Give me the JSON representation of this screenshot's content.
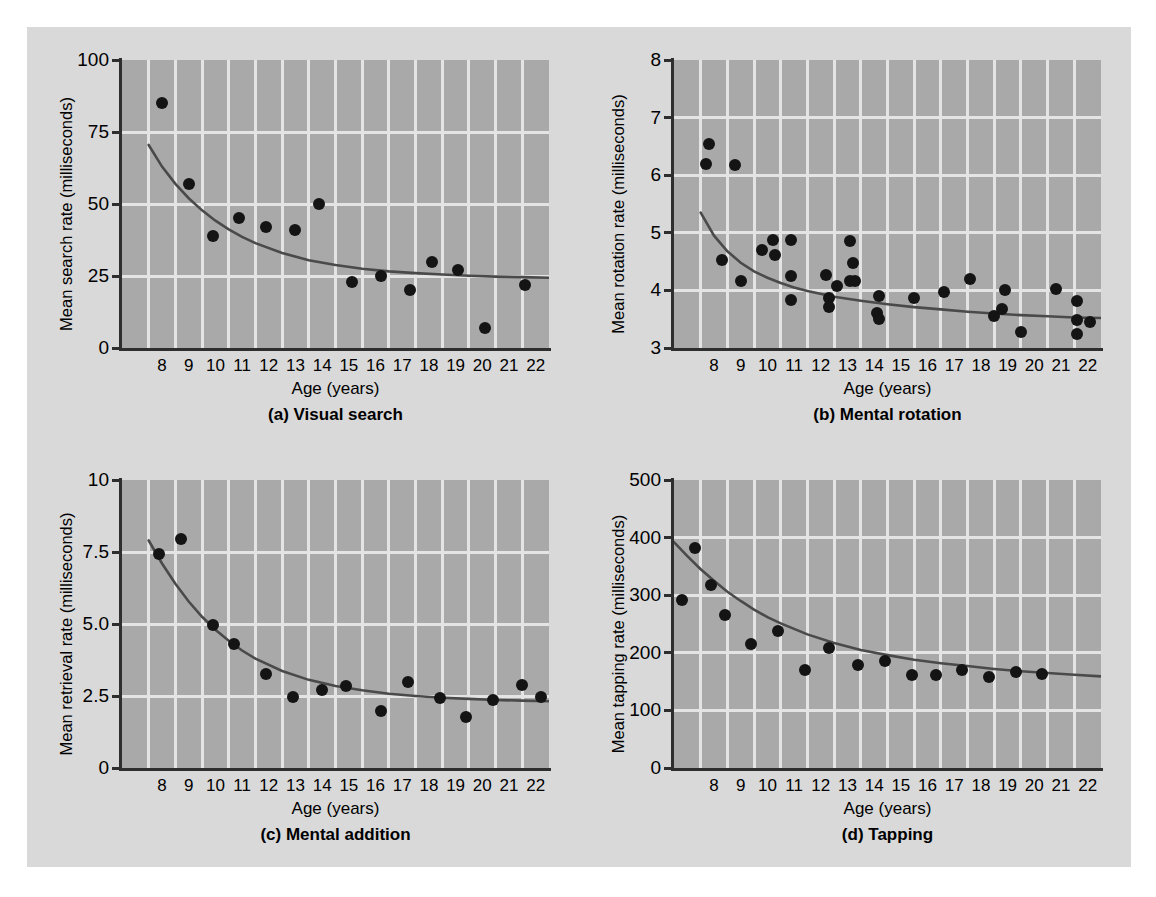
{
  "figure": {
    "background_color": "#d9d9d9",
    "plot_background_color": "#a9a9a9",
    "gridline_color": "#e4e4e4",
    "marker_color": "#141414",
    "curve_color": "#4a4a4a"
  },
  "chart_data": [
    {
      "id": "a",
      "type": "scatter",
      "title": "(a) Visual search",
      "caption": "(a) Visual search",
      "xlabel": "Age (years)",
      "ylabel": "Mean search rate (milliseconds)",
      "xlim": [
        7.0,
        23.0
      ],
      "ylim": [
        0,
        100
      ],
      "xticks": [
        8,
        9,
        10,
        11,
        12,
        13,
        14,
        15,
        16,
        17,
        18,
        19,
        20,
        21,
        22
      ],
      "xtick_labels": [
        "8",
        "9",
        "10",
        "11",
        "12",
        "13",
        "14",
        "15",
        "16",
        "17",
        "18",
        "19",
        "20",
        "21",
        "22"
      ],
      "yticks": [
        0,
        25,
        50,
        75,
        100
      ],
      "ytick_labels": [
        "0",
        "25",
        "50",
        "75",
        "100"
      ],
      "grid": true,
      "legend": "none",
      "points": [
        {
          "x": 8.5,
          "y": 85
        },
        {
          "x": 9.5,
          "y": 57
        },
        {
          "x": 10.4,
          "y": 39
        },
        {
          "x": 11.4,
          "y": 45
        },
        {
          "x": 12.4,
          "y": 42
        },
        {
          "x": 13.5,
          "y": 41
        },
        {
          "x": 14.4,
          "y": 50
        },
        {
          "x": 15.6,
          "y": 23
        },
        {
          "x": 16.7,
          "y": 25
        },
        {
          "x": 17.8,
          "y": 20
        },
        {
          "x": 18.6,
          "y": 30
        },
        {
          "x": 19.6,
          "y": 27
        },
        {
          "x": 20.6,
          "y": 7
        },
        {
          "x": 22.1,
          "y": 22
        }
      ],
      "fit_curve": {
        "label": "fitted exponential decay",
        "x": [
          8.0,
          8.5,
          9.0,
          9.5,
          10.0,
          10.5,
          11.0,
          11.5,
          12.0,
          13.0,
          14.0,
          15.0,
          16.0,
          17.0,
          18.0,
          19.0,
          20.0,
          21.0,
          22.0,
          23.0
        ],
        "y": [
          70.5,
          63.0,
          57.0,
          52.0,
          47.8,
          44.2,
          41.2,
          38.6,
          36.4,
          33.0,
          30.5,
          28.8,
          27.5,
          26.6,
          26.0,
          25.5,
          25.1,
          24.8,
          24.6,
          24.4
        ]
      }
    },
    {
      "id": "b",
      "type": "scatter",
      "title": "(b) Mental rotation",
      "caption": "(b) Mental rotation",
      "xlabel": "Age (years)",
      "ylabel": "Mean rotation rate (milliseconds)",
      "xlim": [
        7.0,
        23.0
      ],
      "ylim": [
        3,
        8
      ],
      "xticks": [
        8,
        9,
        10,
        11,
        12,
        13,
        14,
        15,
        16,
        17,
        18,
        19,
        20,
        21,
        22
      ],
      "xtick_labels": [
        "8",
        "9",
        "10",
        "11",
        "12",
        "13",
        "14",
        "15",
        "16",
        "17",
        "18",
        "19",
        "20",
        "21",
        "22"
      ],
      "yticks": [
        3,
        4,
        5,
        6,
        7,
        8
      ],
      "ytick_labels": [
        "3",
        "4",
        "5",
        "6",
        "7",
        "8"
      ],
      "grid": true,
      "legend": "none",
      "points": [
        {
          "x": 8.3,
          "y": 6.55
        },
        {
          "x": 8.2,
          "y": 6.2
        },
        {
          "x": 9.3,
          "y": 6.18
        },
        {
          "x": 8.8,
          "y": 4.52
        },
        {
          "x": 9.5,
          "y": 4.17
        },
        {
          "x": 10.3,
          "y": 4.7
        },
        {
          "x": 10.7,
          "y": 4.88
        },
        {
          "x": 10.8,
          "y": 4.62
        },
        {
          "x": 11.4,
          "y": 4.87
        },
        {
          "x": 11.4,
          "y": 4.25
        },
        {
          "x": 11.4,
          "y": 3.83
        },
        {
          "x": 12.7,
          "y": 4.27
        },
        {
          "x": 12.8,
          "y": 3.87
        },
        {
          "x": 12.8,
          "y": 3.72
        },
        {
          "x": 13.1,
          "y": 4.07
        },
        {
          "x": 13.6,
          "y": 4.85
        },
        {
          "x": 13.7,
          "y": 4.48
        },
        {
          "x": 13.6,
          "y": 4.17
        },
        {
          "x": 13.8,
          "y": 4.17
        },
        {
          "x": 14.7,
          "y": 3.9
        },
        {
          "x": 14.6,
          "y": 3.6
        },
        {
          "x": 14.7,
          "y": 3.5
        },
        {
          "x": 16.0,
          "y": 3.87
        },
        {
          "x": 17.1,
          "y": 3.98
        },
        {
          "x": 18.1,
          "y": 4.2
        },
        {
          "x": 19.0,
          "y": 3.55
        },
        {
          "x": 19.3,
          "y": 3.67
        },
        {
          "x": 19.4,
          "y": 4.0
        },
        {
          "x": 20.0,
          "y": 3.27
        },
        {
          "x": 21.3,
          "y": 4.02
        },
        {
          "x": 22.1,
          "y": 3.82
        },
        {
          "x": 22.1,
          "y": 3.48
        },
        {
          "x": 22.1,
          "y": 3.25
        },
        {
          "x": 22.6,
          "y": 3.45
        }
      ],
      "fit_curve": {
        "label": "fitted exponential decay",
        "x": [
          8.0,
          8.5,
          9.0,
          9.5,
          10.0,
          10.5,
          11.0,
          11.5,
          12.0,
          13.0,
          14.0,
          15.0,
          16.0,
          17.0,
          18.0,
          19.0,
          20.0,
          21.0,
          22.0,
          23.0
        ],
        "y": [
          5.35,
          4.95,
          4.68,
          4.48,
          4.33,
          4.22,
          4.13,
          4.05,
          3.99,
          3.89,
          3.82,
          3.76,
          3.71,
          3.67,
          3.63,
          3.6,
          3.57,
          3.55,
          3.53,
          3.52
        ]
      }
    },
    {
      "id": "c",
      "type": "scatter",
      "title": "(c) Mental addition",
      "caption": "(c) Mental addition",
      "xlabel": "Age (years)",
      "ylabel": "Mean retrieval rate (milliseconds)",
      "xlim": [
        7.0,
        23.0
      ],
      "ylim": [
        0,
        10
      ],
      "xticks": [
        8,
        9,
        10,
        11,
        12,
        13,
        14,
        15,
        16,
        17,
        18,
        19,
        20,
        21,
        22
      ],
      "xtick_labels": [
        "8",
        "9",
        "10",
        "11",
        "12",
        "13",
        "14",
        "15",
        "16",
        "17",
        "18",
        "19",
        "20",
        "21",
        "22"
      ],
      "yticks": [
        0,
        2.5,
        5.0,
        7.5,
        10
      ],
      "ytick_labels": [
        "0",
        "2.5",
        "5.0",
        "7.5",
        "10"
      ],
      "grid": true,
      "legend": "none",
      "points": [
        {
          "x": 8.4,
          "y": 7.42
        },
        {
          "x": 9.2,
          "y": 7.95
        },
        {
          "x": 10.4,
          "y": 4.98
        },
        {
          "x": 11.2,
          "y": 4.32
        },
        {
          "x": 12.4,
          "y": 3.25
        },
        {
          "x": 13.4,
          "y": 2.48
        },
        {
          "x": 14.5,
          "y": 2.7
        },
        {
          "x": 15.4,
          "y": 2.85
        },
        {
          "x": 16.7,
          "y": 1.98
        },
        {
          "x": 17.7,
          "y": 2.97
        },
        {
          "x": 18.9,
          "y": 2.42
        },
        {
          "x": 19.9,
          "y": 1.78
        },
        {
          "x": 20.9,
          "y": 2.35
        },
        {
          "x": 22.0,
          "y": 2.88
        },
        {
          "x": 22.7,
          "y": 2.45
        }
      ],
      "fit_curve": {
        "label": "fitted exponential decay",
        "x": [
          8.0,
          8.5,
          9.0,
          9.5,
          10.0,
          10.5,
          11.0,
          11.5,
          12.0,
          13.0,
          14.0,
          15.0,
          16.0,
          17.0,
          18.0,
          19.0,
          20.0,
          21.0,
          22.0,
          23.0
        ],
        "y": [
          7.9,
          7.1,
          6.4,
          5.78,
          5.25,
          4.8,
          4.42,
          4.08,
          3.8,
          3.37,
          3.06,
          2.85,
          2.7,
          2.58,
          2.5,
          2.44,
          2.4,
          2.36,
          2.34,
          2.32
        ]
      }
    },
    {
      "id": "d",
      "type": "scatter",
      "title": "(d) Tapping",
      "caption": "(d) Tapping",
      "xlabel": "Age (years)",
      "ylabel": "Mean tapping rate (milliseconds)",
      "xlim": [
        7.0,
        23.0
      ],
      "ylim": [
        0,
        500
      ],
      "xticks": [
        8,
        9,
        10,
        11,
        12,
        13,
        14,
        15,
        16,
        17,
        18,
        19,
        20,
        21,
        22
      ],
      "xtick_labels": [
        "8",
        "9",
        "10",
        "11",
        "12",
        "13",
        "14",
        "15",
        "16",
        "17",
        "18",
        "19",
        "20",
        "21",
        "22"
      ],
      "yticks": [
        0,
        100,
        200,
        300,
        400,
        500
      ],
      "ytick_labels": [
        "0",
        "100",
        "200",
        "300",
        "400",
        "500"
      ],
      "grid": true,
      "legend": "none",
      "points": [
        {
          "x": 7.3,
          "y": 291
        },
        {
          "x": 7.8,
          "y": 382
        },
        {
          "x": 8.4,
          "y": 317
        },
        {
          "x": 8.9,
          "y": 266
        },
        {
          "x": 9.9,
          "y": 216
        },
        {
          "x": 10.9,
          "y": 237
        },
        {
          "x": 11.9,
          "y": 170
        },
        {
          "x": 12.8,
          "y": 208
        },
        {
          "x": 13.9,
          "y": 179
        },
        {
          "x": 14.9,
          "y": 186
        },
        {
          "x": 15.9,
          "y": 162
        },
        {
          "x": 16.8,
          "y": 161
        },
        {
          "x": 17.8,
          "y": 170
        },
        {
          "x": 18.8,
          "y": 158
        },
        {
          "x": 19.8,
          "y": 166
        },
        {
          "x": 20.8,
          "y": 163
        }
      ],
      "fit_curve": {
        "label": "fitted exponential decay",
        "x": [
          7.0,
          7.5,
          8.0,
          8.5,
          9.0,
          9.5,
          10.0,
          10.5,
          11.0,
          12.0,
          13.0,
          14.0,
          15.0,
          16.0,
          17.0,
          18.0,
          19.0,
          20.0,
          21.0,
          22.0,
          23.0
        ],
        "y": [
          392,
          368,
          345,
          325,
          306,
          290,
          275,
          262,
          251,
          232,
          217,
          205,
          196,
          188,
          182,
          177,
          172,
          168,
          165,
          162,
          159
        ]
      }
    }
  ]
}
